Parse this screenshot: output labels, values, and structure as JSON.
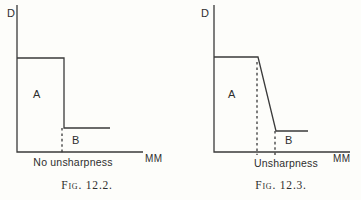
{
  "page": {
    "background": "#fdfdfa"
  },
  "colors": {
    "line": "#3a3a3a",
    "text": "#2e2e2e"
  },
  "figures": [
    {
      "y_axis_label": "D",
      "x_axis_label": "MM",
      "region_a_label": "A",
      "region_b_label": "B",
      "axis_annotation": "No unsharpness",
      "caption": "Fig. 12.2.",
      "geometry": {
        "polylines": [
          {
            "name": "fig1-axes",
            "points": [
              [
                17,
                5
              ],
              [
                17,
                152
              ],
              [
                143,
                152
              ]
            ]
          },
          {
            "name": "fig1-density-profile",
            "points": [
              [
                17,
                58
              ],
              [
                64,
                58
              ],
              [
                64,
                128
              ],
              [
                110,
                128
              ]
            ]
          },
          {
            "name": "fig1-edge-dashed-line",
            "points": [
              [
                62,
                128
              ],
              [
                62,
                155
              ]
            ],
            "dashed": true
          }
        ]
      }
    },
    {
      "y_axis_label": "D",
      "x_axis_label": "MM",
      "region_a_label": "A",
      "region_b_label": "B",
      "axis_annotation": "Unsharpness",
      "caption": "Fig. 12.3.",
      "geometry": {
        "polylines": [
          {
            "name": "fig2-axes",
            "points": [
              [
                214,
                5
              ],
              [
                214,
                152
              ],
              [
                350,
                152
              ]
            ]
          },
          {
            "name": "fig2-density-profile",
            "points": [
              [
                214,
                57
              ],
              [
                258,
                57
              ],
              [
                276,
                131
              ],
              [
                308,
                131
              ]
            ]
          },
          {
            "name": "fig2-penumbra-start-dashed-line",
            "points": [
              [
                257,
                62
              ],
              [
                257,
                155
              ]
            ],
            "dashed": true
          },
          {
            "name": "fig2-penumbra-end-dashed-line",
            "points": [
              [
                275,
                131
              ],
              [
                275,
                155
              ]
            ],
            "dashed": true
          }
        ]
      }
    }
  ]
}
